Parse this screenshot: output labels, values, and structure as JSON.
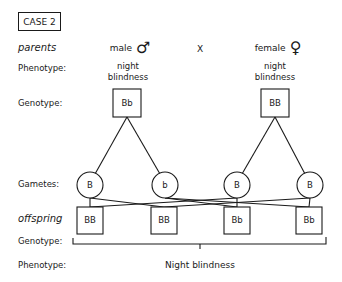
{
  "case_label": "CASE 2",
  "rows": {
    "parents": "parents",
    "phenotype_parent": "Phenotype:",
    "genotype_parent": "Genotype:",
    "gametes": "Gametes:",
    "offspring": "offspring",
    "genotype_offspring": "Genotype:",
    "phenotype_offspring": "Phenotype:"
  },
  "cross_symbol": "X",
  "parents": {
    "male": {
      "label": "male",
      "symbol": "♂",
      "phenotype_line1": "night",
      "phenotype_line2": "blindness",
      "genotype": "Bb",
      "gametes": [
        "B",
        "b"
      ]
    },
    "female": {
      "label": "female",
      "symbol": "♀",
      "phenotype_line1": "night",
      "phenotype_line2": "blindness",
      "genotype": "BB",
      "gametes": [
        "B",
        "B"
      ]
    }
  },
  "offspring": {
    "genotypes": [
      "BB",
      "BB",
      "Bb",
      "Bb"
    ],
    "phenotype": "Night blindness"
  },
  "colors": {
    "line": "#1a1a1a",
    "background": "#ffffff"
  }
}
